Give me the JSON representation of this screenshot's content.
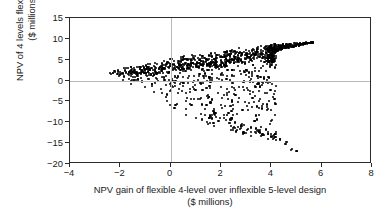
{
  "chart_data": {
    "type": "scatter",
    "title": "",
    "xlabel": "NPV gain of flexible 4-level over inflexible 5-level design\n($ millions)",
    "ylabel": "NPV of 4 levels flexible design\n($ millions)",
    "xlim": [
      -4,
      8
    ],
    "ylim": [
      -20,
      15
    ],
    "xticks": [
      -4,
      -2,
      0,
      2,
      4,
      6,
      8
    ],
    "yticks": [
      15,
      10,
      5,
      0,
      -5,
      -10,
      -15,
      -20
    ],
    "xtick_labels": [
      "−4",
      "−2",
      "0",
      "2",
      "4",
      "6",
      "8"
    ],
    "ytick_labels": [
      "15",
      "10",
      "5",
      "0",
      "−5",
      "−10",
      "−15",
      "−20"
    ],
    "grid": "zero-lines-only",
    "grid_color": "#b9b9b9",
    "legend": "none",
    "marker_color": "#000000",
    "marker_size_px": 2.1,
    "n_points": 900,
    "series": [
      {
        "name": "Simulated outcomes",
        "upper_envelope": [
          [
            -2.5,
            2.1
          ],
          [
            0.0,
            5.4
          ],
          [
            2.0,
            7.0
          ],
          [
            3.5,
            8.4
          ],
          [
            4.5,
            8.9
          ],
          [
            5.6,
            9.3
          ]
        ],
        "lower_envelope": [
          [
            -2.5,
            1.6
          ],
          [
            -1.0,
            -2.0
          ],
          [
            0.0,
            -6.0
          ],
          [
            0.6,
            -8.6
          ],
          [
            1.3,
            -10.2
          ],
          [
            2.2,
            -11.5
          ],
          [
            3.3,
            -13.6
          ],
          [
            4.2,
            -14.8
          ],
          [
            5.0,
            -17.0
          ]
        ],
        "x_range": [
          -2.55,
          5.65
        ],
        "y_range": [
          -17.2,
          9.45
        ],
        "dense_right_edge_x": 4.15,
        "sparse_tail": [
          [
            1.55,
            -10.1
          ],
          [
            1.9,
            -9.6
          ],
          [
            2.25,
            -8.2
          ],
          [
            2.45,
            -9.1
          ],
          [
            2.55,
            -11.4
          ],
          [
            2.9,
            -10.6
          ],
          [
            3.05,
            -11.9
          ],
          [
            3.2,
            -11.4
          ],
          [
            3.35,
            -12.3
          ],
          [
            3.5,
            -12.2
          ],
          [
            3.7,
            -13.1
          ],
          [
            3.85,
            -12.9
          ],
          [
            4.0,
            -13.4
          ],
          [
            4.1,
            -13.8
          ],
          [
            4.15,
            -13.5
          ],
          [
            4.35,
            -14.0
          ],
          [
            4.6,
            -15.3
          ],
          [
            4.62,
            -14.7
          ],
          [
            4.8,
            -16.9
          ],
          [
            4.82,
            -16.4
          ],
          [
            5.0,
            -16.9
          ]
        ]
      }
    ]
  }
}
